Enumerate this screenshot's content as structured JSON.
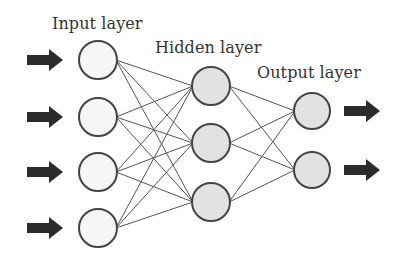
{
  "diagram": {
    "labels": {
      "input": "Input layer",
      "hidden": "Hidden layer",
      "output": "Output layer"
    },
    "layers": [
      {
        "name": "input",
        "nodes": 4,
        "fill": "#f6f6f6"
      },
      {
        "name": "hidden",
        "nodes": 3,
        "fill": "#e2e2e2"
      },
      {
        "name": "output",
        "nodes": 2,
        "fill": "#e2e2e2"
      }
    ],
    "connections": "fully-connected",
    "input_arrows": 4,
    "output_arrows": 2,
    "colors": {
      "stroke": "#444444",
      "edge": "#555555",
      "arrow": "#2b2b2b"
    }
  }
}
